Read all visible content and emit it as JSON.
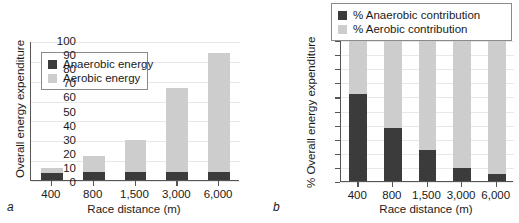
{
  "figure": {
    "panels": [
      {
        "letter": "a",
        "ylabel": "Overall energy expenditure",
        "xlabel": "Race distance (m)",
        "legend": [
          {
            "label": "Anaerobic energy",
            "swatch": "anaerobic"
          },
          {
            "label": "Aerobic energy",
            "swatch": "aerobic"
          }
        ]
      },
      {
        "letter": "b",
        "ylabel": "% Overall energy expenditure",
        "xlabel": "Race distance (m)",
        "legend": [
          {
            "label": "% Anaerobic contribution",
            "swatch": "anaerobic"
          },
          {
            "label": "% Aerobic contribution",
            "swatch": "aerobic"
          }
        ]
      }
    ]
  },
  "chart_data": [
    {
      "type": "bar",
      "panel": "a",
      "stacked": true,
      "title": "",
      "xlabel": "Race distance (m)",
      "ylabel": "Overall energy expenditure",
      "categories": [
        "400",
        "800",
        "1,500",
        "3,000",
        "6,000"
      ],
      "series": [
        {
          "name": "Anaerobic energy",
          "color": "#3b3b3b",
          "values": [
            6,
            7,
            7,
            7,
            7
          ]
        },
        {
          "name": "Aerobic energy",
          "color": "#cdcdcd",
          "values": [
            4,
            13,
            26,
            69,
            98
          ]
        }
      ],
      "totals": [
        10,
        20,
        33,
        76,
        105
      ],
      "ylim": [
        0,
        115
      ],
      "yticks_labeled": false,
      "grid": true,
      "legend_position": "upper-left"
    },
    {
      "type": "bar",
      "panel": "b",
      "stacked": true,
      "title": "",
      "xlabel": "Race distance (m)",
      "ylabel": "% Overall energy expenditure",
      "categories": [
        "400",
        "800",
        "1,500",
        "3,000",
        "6,000"
      ],
      "ytick_labels": [
        "0",
        "10",
        "20",
        "30",
        "40",
        "50",
        "60",
        "70",
        "80",
        "90",
        "100"
      ],
      "ytick_values": [
        0,
        10,
        20,
        30,
        40,
        50,
        60,
        70,
        80,
        90,
        100
      ],
      "series": [
        {
          "name": "% Anaerobic contribution",
          "color": "#3b3b3b",
          "values": [
            61.5,
            37.5,
            22,
            9,
            5
          ]
        },
        {
          "name": "% Aerobic contribution",
          "color": "#cdcdcd",
          "values": [
            38.5,
            62.5,
            78,
            91,
            95
          ]
        }
      ],
      "ylim": [
        0,
        100
      ],
      "grid": true,
      "legend_position": "above-right"
    }
  ]
}
